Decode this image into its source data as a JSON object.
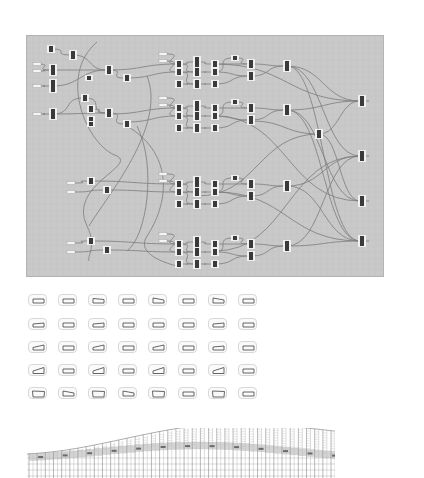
{
  "figure": {
    "node_graph": {
      "background": "#c9c9c9",
      "wire_color": "#6e6e6e",
      "node_color": "#3a3a3a",
      "node_border": "#f0f0f0",
      "clusters": [
        {
          "name": "cluster-1",
          "y": 62
        },
        {
          "name": "cluster-2",
          "y": 108
        },
        {
          "name": "cluster-3",
          "y": 182
        },
        {
          "name": "cluster-4",
          "y": 240
        }
      ],
      "outputs_y": [
        100,
        156,
        200,
        240
      ]
    },
    "profile_grid": {
      "columns": 8,
      "rows": 5,
      "stroke": "#555555",
      "profiles": [
        [
          "flat",
          "flat",
          "taper-r",
          "flat",
          "taper-l",
          "flat",
          "taper-l",
          "flat"
        ],
        [
          "slope-1",
          "flat",
          "slope-1",
          "flat",
          "flat",
          "flat",
          "slope-1",
          "flat"
        ],
        [
          "slope-2",
          "flat",
          "slope-2",
          "flat",
          "slope-2",
          "flat",
          "slope-1",
          "flat"
        ],
        [
          "slope-3",
          "flat",
          "slope-3",
          "flat",
          "slope-3",
          "flat",
          "slope-3",
          "flat"
        ],
        [
          "wide",
          "taper-l",
          "wide",
          "taper-l",
          "wide",
          "flat",
          "wide",
          "flat"
        ]
      ]
    },
    "elevation": {
      "stroke": "#8a8a8a",
      "band_fill": "#b9b9b9",
      "dark_band": "#6a6a6a",
      "columns": 38
    }
  }
}
